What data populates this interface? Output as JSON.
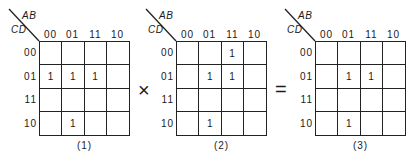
{
  "figure": {
    "row_var": "CD",
    "col_var": "AB",
    "col_labels": [
      "00",
      "01",
      "11",
      "10"
    ],
    "row_labels": [
      "00",
      "01",
      "11",
      "10"
    ],
    "operator_1": "×",
    "operator_2": "=",
    "maps": [
      {
        "caption": "(1)",
        "cells": [
          [
            "",
            "",
            "",
            ""
          ],
          [
            "1",
            "1",
            "1",
            ""
          ],
          [
            "",
            "",
            "",
            ""
          ],
          [
            "",
            "1",
            "",
            ""
          ]
        ]
      },
      {
        "caption": "(2)",
        "cells": [
          [
            "",
            "",
            "1",
            ""
          ],
          [
            "",
            "1",
            "1",
            ""
          ],
          [
            "",
            "",
            "",
            ""
          ],
          [
            "",
            "1",
            "",
            ""
          ]
        ]
      },
      {
        "caption": "(3)",
        "cells": [
          [
            "",
            "",
            "",
            ""
          ],
          [
            "",
            "1",
            "1",
            ""
          ],
          [
            "",
            "",
            "",
            ""
          ],
          [
            "",
            "1",
            "",
            ""
          ]
        ]
      }
    ]
  }
}
